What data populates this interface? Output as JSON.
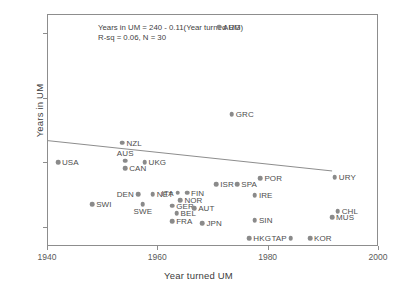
{
  "chart_data": {
    "type": "scatter",
    "title": "",
    "xlabel": "Year turned UM",
    "ylabel": "Years in UM",
    "xlim": [
      1940,
      2000
    ],
    "ylim": [
      7,
      43
    ],
    "xticks": [
      1940,
      1960,
      1980,
      2000
    ],
    "yticks": [
      10,
      20,
      30,
      40
    ],
    "grid": false,
    "legend": "none",
    "annotations": [
      "Years in UM = 240 - 0.11(Year turned UM)",
      "R-sq = 0.06, N = 30"
    ],
    "fit": {
      "type": "linear",
      "intercept": 240,
      "slope": -0.11,
      "r_squared": 0.06,
      "n": 30,
      "x_start": 1940,
      "y_start": 23.5,
      "x_end": 1991.5,
      "y_end": 18.8
    },
    "point_labels": [
      "USA",
      "NZL",
      "AUS",
      "UKG",
      "CAN",
      "SWI",
      "DEN",
      "NET",
      "SWE",
      "ITA",
      "FIN",
      "NOR",
      "GER",
      "BEL",
      "AUT",
      "FRA",
      "ISR",
      "SPA",
      "POR",
      "IRE",
      "JPN",
      "ARG",
      "GRC",
      "URY",
      "CHL",
      "MUS",
      "SIN",
      "HKG",
      "TAP",
      "KOR"
    ],
    "points": [
      {
        "label": "USA",
        "x": 1941.8,
        "y": 20.2,
        "lpos": "right"
      },
      {
        "label": "NZL",
        "x": 1953.5,
        "y": 23.2,
        "lpos": "right"
      },
      {
        "label": "AUS",
        "x": 1954.0,
        "y": 20.4,
        "lpos": "above"
      },
      {
        "label": "UKG",
        "x": 1957.5,
        "y": 20.2,
        "lpos": "right"
      },
      {
        "label": "CAN",
        "x": 1954.0,
        "y": 19.2,
        "lpos": "right"
      },
      {
        "label": "SWI",
        "x": 1948.0,
        "y": 13.6,
        "lpos": "right"
      },
      {
        "label": "DEN",
        "x": 1956.3,
        "y": 15.2,
        "lpos": "left"
      },
      {
        "label": "NET",
        "x": 1959.0,
        "y": 15.2,
        "lpos": "right"
      },
      {
        "label": "SWE",
        "x": 1957.2,
        "y": 13.6,
        "lpos": "below"
      },
      {
        "label": "ITA",
        "x": 1963.5,
        "y": 15.4,
        "lpos": "left"
      },
      {
        "label": "FIN",
        "x": 1965.2,
        "y": 15.4,
        "lpos": "right"
      },
      {
        "label": "NOR",
        "x": 1964.0,
        "y": 14.3,
        "lpos": "right"
      },
      {
        "label": "GER",
        "x": 1962.5,
        "y": 13.4,
        "lpos": "right"
      },
      {
        "label": "BEL",
        "x": 1963.3,
        "y": 12.2,
        "lpos": "right"
      },
      {
        "label": "AUT",
        "x": 1966.5,
        "y": 13.0,
        "lpos": "right"
      },
      {
        "label": "FRA",
        "x": 1962.5,
        "y": 11.0,
        "lpos": "right"
      },
      {
        "label": "ISR",
        "x": 1970.5,
        "y": 16.7,
        "lpos": "right"
      },
      {
        "label": "SPA",
        "x": 1974.3,
        "y": 16.7,
        "lpos": "right"
      },
      {
        "label": "POR",
        "x": 1978.5,
        "y": 17.7,
        "lpos": "right"
      },
      {
        "label": "IRE",
        "x": 1977.5,
        "y": 15.0,
        "lpos": "right"
      },
      {
        "label": "JPN",
        "x": 1968.0,
        "y": 10.7,
        "lpos": "right"
      },
      {
        "label": "ARG",
        "x": 1971.0,
        "y": 41.2,
        "lpos": "right"
      },
      {
        "label": "GRC",
        "x": 1973.3,
        "y": 27.6,
        "lpos": "right"
      },
      {
        "label": "URY",
        "x": 1992.0,
        "y": 17.8,
        "lpos": "right"
      },
      {
        "label": "CHL",
        "x": 1992.5,
        "y": 12.6,
        "lpos": "right"
      },
      {
        "label": "MUS",
        "x": 1991.5,
        "y": 11.6,
        "lpos": "right"
      },
      {
        "label": "SIN",
        "x": 1977.5,
        "y": 11.2,
        "lpos": "right"
      },
      {
        "label": "HKG",
        "x": 1976.5,
        "y": 8.4,
        "lpos": "right"
      },
      {
        "label": "TAP",
        "x": 1984.0,
        "y": 8.4,
        "lpos": "left"
      },
      {
        "label": "KOR",
        "x": 1987.5,
        "y": 8.4,
        "lpos": "right"
      }
    ]
  }
}
